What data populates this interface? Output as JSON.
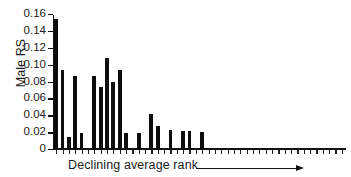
{
  "chart_data": {
    "type": "bar",
    "title": "",
    "xlabel": "Declining average rank",
    "ylabel": "Male RS",
    "ylim": [
      0,
      0.16
    ],
    "yticks": [
      0,
      0.02,
      0.04,
      0.06,
      0.08,
      0.1,
      0.12,
      0.14,
      0.16
    ],
    "ytick_labels": [
      "0",
      "0.02",
      "0.04",
      "0.06",
      "0.08",
      "0.10",
      "0.12",
      "0.14",
      "0.16"
    ],
    "grid": false,
    "legend": null,
    "bar_color": "#0d0d0d",
    "n_categories": 46,
    "categories": [
      "1",
      "2",
      "3",
      "4",
      "5",
      "6",
      "7",
      "8",
      "9",
      "10",
      "11",
      "12",
      "13",
      "14",
      "15",
      "16",
      "17",
      "18",
      "19",
      "20",
      "21",
      "22",
      "23",
      "24",
      "25",
      "26",
      "27",
      "28",
      "29",
      "30",
      "31",
      "32",
      "33",
      "34",
      "35",
      "36",
      "37",
      "38",
      "39",
      "40",
      "41",
      "42",
      "43",
      "44",
      "45",
      "46"
    ],
    "values": [
      0.154,
      0.094,
      0.014,
      0.087,
      0.019,
      0.0,
      0.087,
      0.074,
      0.108,
      0.08,
      0.094,
      0.019,
      0.0,
      0.019,
      0.0,
      0.041,
      0.027,
      0.0,
      0.022,
      0.0,
      0.021,
      0.021,
      0.0,
      0.02,
      0.0,
      0.0,
      0.0,
      0.0,
      0.0,
      0.0,
      0.0,
      0.0,
      0.0,
      0.0,
      0.0,
      0.0,
      0.0,
      0.0,
      0.0,
      0.0,
      0.0,
      0.0,
      0.0,
      0.0,
      0.0,
      0.0
    ],
    "annotations": [
      {
        "text": "Declining average rank",
        "kind": "axis-caption-with-arrow",
        "direction": "right"
      }
    ]
  },
  "axis": {
    "y_label": "Male RS",
    "x_caption": "Declining average rank"
  },
  "icons": {
    "arrow": "arrow-right-icon"
  }
}
